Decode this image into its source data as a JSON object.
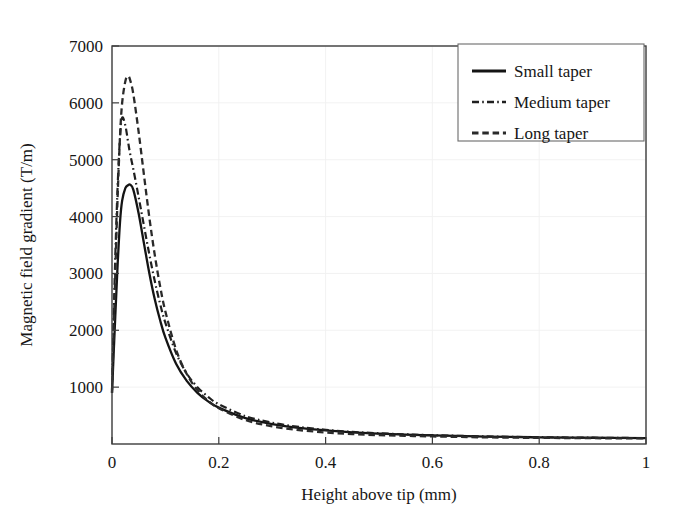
{
  "chart_data": {
    "type": "line",
    "title": "",
    "xlabel": "Height above tip (mm)",
    "ylabel": "Magnetic field gradient (T/m)",
    "xlim": [
      0,
      1
    ],
    "ylim": [
      0,
      7000
    ],
    "xticks": [
      "0",
      "0.2",
      "0.4",
      "0.6",
      "0.8",
      "1"
    ],
    "xtick_values": [
      0,
      0.2,
      0.4,
      0.6,
      0.8,
      1
    ],
    "yticks": [
      "1000",
      "2000",
      "3000",
      "4000",
      "5000",
      "6000",
      "7000"
    ],
    "ytick_values": [
      1000,
      2000,
      3000,
      4000,
      5000,
      6000,
      7000
    ],
    "grid": true,
    "legend_position": "top-right",
    "x": [
      0,
      0.005,
      0.01,
      0.015,
      0.019,
      0.025,
      0.03,
      0.034,
      0.04,
      0.05,
      0.06,
      0.07,
      0.08,
      0.09,
      0.1,
      0.12,
      0.14,
      0.16,
      0.18,
      0.2,
      0.25,
      0.3,
      0.35,
      0.4,
      0.45,
      0.5,
      0.55,
      0.6,
      0.7,
      0.8,
      0.9,
      1.0
    ],
    "series": [
      {
        "name": "Small taper",
        "style": "solid",
        "color": "#141414",
        "peak_x": 0.034,
        "peak_y": 4560,
        "values": [
          900,
          2000,
          3050,
          3900,
          4280,
          4500,
          4550,
          4560,
          4470,
          4050,
          3520,
          3000,
          2550,
          2180,
          1870,
          1410,
          1110,
          900,
          750,
          640,
          455,
          350,
          285,
          240,
          205,
          182,
          165,
          152,
          130,
          118,
          110,
          103
        ]
      },
      {
        "name": "Medium taper",
        "style": "dashdot",
        "color": "#1f1f1f",
        "peak_x": 0.019,
        "peak_y": 5740,
        "values": [
          950,
          2900,
          4400,
          5400,
          5740,
          5600,
          5320,
          5100,
          4830,
          4340,
          3830,
          3330,
          2870,
          2470,
          2130,
          1600,
          1240,
          1000,
          830,
          700,
          490,
          375,
          300,
          250,
          213,
          188,
          170,
          155,
          133,
          120,
          111,
          104
        ]
      },
      {
        "name": "Long taper",
        "style": "dashed",
        "color": "#2a2a2a",
        "peak_x": 0.03,
        "peak_y": 6470,
        "values": [
          900,
          2600,
          4200,
          5400,
          6000,
          6380,
          6470,
          6400,
          6150,
          5480,
          4720,
          3980,
          3330,
          2780,
          2330,
          1660,
          1230,
          950,
          760,
          630,
          420,
          310,
          245,
          203,
          175,
          156,
          143,
          133,
          117,
          108,
          102,
          98
        ]
      }
    ]
  },
  "legend": {
    "items": [
      {
        "label": "Small taper"
      },
      {
        "label": "Medium taper"
      },
      {
        "label": "Long taper"
      }
    ]
  }
}
